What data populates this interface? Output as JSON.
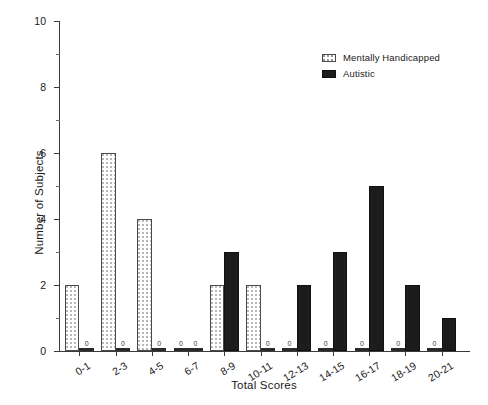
{
  "chart_data": {
    "type": "bar",
    "title": "",
    "xlabel": "Total Scores",
    "ylabel": "Number of Subjects",
    "categories": [
      "0-1",
      "2-3",
      "4-5",
      "6-7",
      "8-9",
      "10-11",
      "12-13",
      "14-15",
      "16-17",
      "18-19",
      "20-21"
    ],
    "series": [
      {
        "name": "Mentally Handicapped",
        "values": [
          2,
          6,
          4,
          0,
          2,
          2,
          0,
          0,
          0,
          0,
          0
        ],
        "fill": "dotted-white",
        "color": "#ffffff"
      },
      {
        "name": "Autistic",
        "values": [
          0,
          0,
          0,
          0,
          3,
          0,
          2,
          3,
          5,
          2,
          1
        ],
        "fill": "solid-black",
        "color": "#1c1c1c"
      }
    ],
    "ylim": [
      0,
      10
    ],
    "ytick_labels": [
      "0",
      "2",
      "4",
      "6",
      "8",
      "10"
    ],
    "ytick_values": [
      0,
      2,
      4,
      6,
      8,
      10
    ],
    "yminor_values": [
      1,
      3,
      5,
      7,
      9
    ],
    "zero_value_label": "0",
    "grid": false,
    "legend_position": "top-right"
  },
  "legend": {
    "entries": [
      {
        "label": "Mentally Handicapped",
        "swatch": "dotted-white"
      },
      {
        "label": "Autistic",
        "swatch": "solid-black"
      }
    ]
  }
}
